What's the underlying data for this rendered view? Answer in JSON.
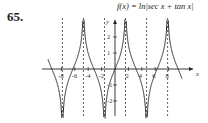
{
  "problem_number": "65.",
  "chart_data": {
    "type": "line",
    "title": "f(x) = ln|sec x + tan x|",
    "xlabel": "x",
    "ylabel": "y",
    "x_ticks": [
      -8,
      -6,
      -4,
      -2,
      2,
      4,
      6,
      8
    ],
    "y_ticks": [
      -2,
      -1,
      1,
      2
    ],
    "xlim": [
      -10,
      10
    ],
    "ylim": [
      -3,
      3
    ],
    "asymptotes": [
      -7.854,
      -4.712,
      -1.571,
      1.571,
      4.712,
      7.854
    ],
    "grid": false,
    "series": [
      {
        "name": "f(x) = ln|sec x + tan x|",
        "function": "ln|sec x + tan x|"
      }
    ]
  }
}
